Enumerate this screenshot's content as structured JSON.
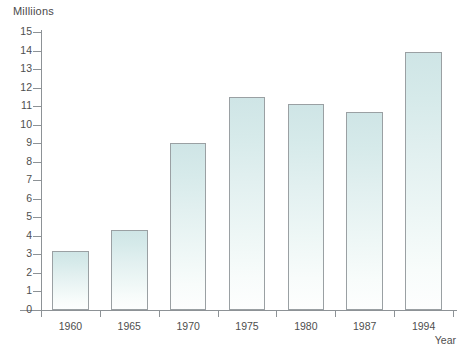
{
  "chart_data": {
    "type": "bar",
    "title": "",
    "ylabel": "Milliions",
    "xlabel": "Year",
    "categories": [
      "1960",
      "1965",
      "1970",
      "1975",
      "1980",
      "1987",
      "1994"
    ],
    "values": [
      3.2,
      4.3,
      9.0,
      11.5,
      11.1,
      10.7,
      13.9
    ],
    "ylim": [
      0,
      15
    ],
    "yticks": [
      "0",
      "1",
      "2",
      "3",
      "4",
      "5",
      "6",
      "7",
      "8",
      "9",
      "10",
      "11",
      "12",
      "13",
      "14",
      "15"
    ],
    "grid": false,
    "legend": false,
    "bar_color": "#d8ecec",
    "bar_border_color": "#9aa0a3",
    "axis_color": "#8d9296",
    "text_color": "#4e4e4e"
  }
}
